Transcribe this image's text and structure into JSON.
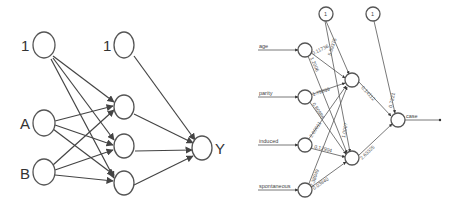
{
  "left_diagram": {
    "input_labels": [
      "1",
      "A",
      "B"
    ],
    "hidden_bias_label": "1",
    "output_label": "Y"
  },
  "right_diagram": {
    "inputs": [
      "age",
      "parity",
      "induced",
      "spontaneous"
    ],
    "bias_labels": [
      "1",
      "1"
    ],
    "output": "case",
    "weights": {
      "age_h1": "0.11736",
      "age_h2": "1.2006",
      "bias_h1": "5.59375",
      "bias_h2": "1.0007",
      "parity_h1": "1.79899",
      "parity_h2": "0.80988",
      "induced_h1": "2.00011",
      "induced_h2": "0.12904",
      "spont_h1": "2.38049",
      "spont_h2": "0.03840",
      "h1_out": "0.14112",
      "h2_out": "2.63325",
      "bias_out": "0.7221"
    }
  }
}
